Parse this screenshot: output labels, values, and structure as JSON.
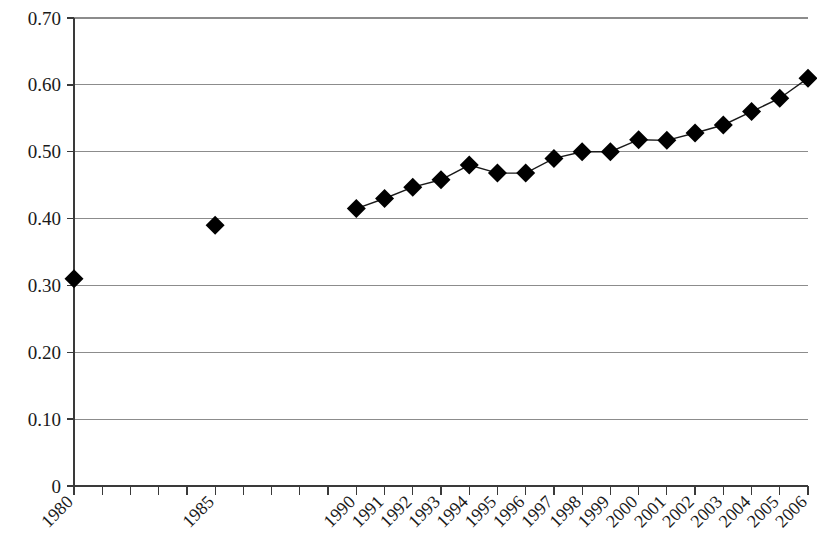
{
  "chart_data": {
    "type": "line",
    "title": "",
    "subtitle": "",
    "xlabel": "",
    "ylabel": "",
    "grid": true,
    "legend": false,
    "legend_position": "none",
    "marker": "filled-diamond",
    "marker_color": "#000000",
    "line_color": "#1a1a1a",
    "grid_color": "#8c8c8c",
    "axis_color": "#3a3a3a",
    "xlim": [
      1980,
      2006
    ],
    "ylim": [
      0,
      0.7
    ],
    "ytick_values": [
      0,
      0.1,
      0.2,
      0.3,
      0.4,
      0.5,
      0.6,
      0.7
    ],
    "ytick_labels": [
      "0",
      "0.10",
      "0.20",
      "0.30",
      "0.40",
      "0.50",
      "0.60",
      "0.70"
    ],
    "xtick_values": [
      1980,
      1981,
      1982,
      1983,
      1984,
      1985,
      1986,
      1987,
      1988,
      1989,
      1990,
      1991,
      1992,
      1993,
      1994,
      1995,
      1996,
      1997,
      1998,
      1999,
      2000,
      2001,
      2002,
      2003,
      2004,
      2005,
      2006
    ],
    "xtick_labels": [
      "1980",
      "",
      "",
      "",
      "",
      "1985",
      "",
      "",
      "",
      "",
      "1990",
      "1991",
      "1992",
      "1993",
      "1994",
      "1995",
      "1996",
      "1997",
      "1998",
      "1999",
      "2000",
      "2001",
      "2002",
      "2003",
      "2004",
      "2005",
      "2006"
    ],
    "xtick_label_rotation": -45,
    "x": [
      1980,
      1985,
      1990,
      1991,
      1992,
      1993,
      1994,
      1995,
      1996,
      1997,
      1998,
      1999,
      2000,
      2001,
      2002,
      2003,
      2004,
      2005,
      2006
    ],
    "values": [
      0.31,
      0.39,
      0.415,
      0.43,
      0.447,
      0.458,
      0.48,
      0.468,
      0.468,
      0.49,
      0.5,
      0.5,
      0.518,
      0.517,
      0.528,
      0.54,
      0.56,
      0.58,
      0.61
    ],
    "connected_from": 1990,
    "isolated_points": [
      {
        "x": 1980,
        "y": 0.31
      },
      {
        "x": 1985,
        "y": 0.39
      }
    ],
    "series": [
      {
        "name": "",
        "points": [
          {
            "x": 1980,
            "y": 0.31
          },
          {
            "x": 1985,
            "y": 0.39
          },
          {
            "x": 1990,
            "y": 0.415
          },
          {
            "x": 1991,
            "y": 0.43
          },
          {
            "x": 1992,
            "y": 0.447
          },
          {
            "x": 1993,
            "y": 0.458
          },
          {
            "x": 1994,
            "y": 0.48
          },
          {
            "x": 1995,
            "y": 0.468
          },
          {
            "x": 1996,
            "y": 0.468
          },
          {
            "x": 1997,
            "y": 0.49
          },
          {
            "x": 1998,
            "y": 0.5
          },
          {
            "x": 1999,
            "y": 0.5
          },
          {
            "x": 2000,
            "y": 0.518
          },
          {
            "x": 2001,
            "y": 0.517
          },
          {
            "x": 2002,
            "y": 0.528
          },
          {
            "x": 2003,
            "y": 0.54
          },
          {
            "x": 2004,
            "y": 0.56
          },
          {
            "x": 2005,
            "y": 0.58
          },
          {
            "x": 2006,
            "y": 0.61
          }
        ]
      }
    ]
  }
}
